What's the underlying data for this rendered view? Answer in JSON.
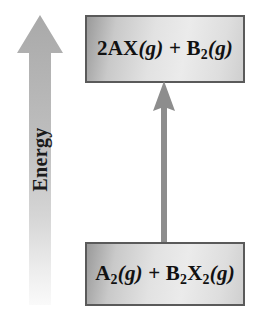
{
  "diagram": {
    "axis": {
      "label": "Energy",
      "icon": "up-arrow-icon",
      "direction": "up",
      "color": "#b0b0b0"
    },
    "reaction_arrow": {
      "icon": "up-arrow-icon",
      "direction": "up",
      "from": "reactants",
      "to": "products",
      "color": "#8d8d8d"
    },
    "states": {
      "products": {
        "name": "products",
        "position": "top",
        "formula_plain": "2AX(g) + B2(g)",
        "parts": {
          "coefficient": "2AX",
          "phase_1": "(g)",
          "plus": "+",
          "species_2": "B",
          "subscript_2": "2",
          "phase_2": "(g)"
        }
      },
      "reactants": {
        "name": "reactants",
        "position": "bottom",
        "formula_plain": "A2(g) + B2X2(g)",
        "parts": {
          "species_1": "A",
          "subscript_1": "2",
          "phase_1": "(g)",
          "plus": "+",
          "species_2": "B",
          "subscript_2a": "2",
          "species_3": "X",
          "subscript_2b": "2",
          "phase_2": "(g)"
        }
      }
    },
    "colors": {
      "box_border": "#5a5a5a",
      "box_fill_light": "#ebebeb",
      "box_fill_dark": "#9a9a9a",
      "axis_arrow": "#b0b0b0",
      "reaction_arrow": "#8d8d8d",
      "text": "#111111",
      "background": "#ffffff"
    }
  }
}
